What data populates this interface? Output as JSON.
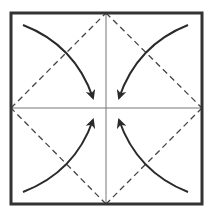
{
  "diagram": {
    "canvas": {
      "width": 215,
      "height": 222
    },
    "colors": {
      "border": "#333333",
      "crease": "#777777",
      "dashed": "#444444",
      "arrow": "#2a2a2a",
      "background": "#ffffff"
    },
    "square": {
      "x1": 11,
      "y1": 13,
      "x2": 202,
      "y2": 204,
      "stroke_width": 3
    },
    "center": {
      "x": 106,
      "y": 108
    },
    "crease_lines": [
      {
        "name": "vertical-crease",
        "x1": 106,
        "y1": 14,
        "x2": 106,
        "y2": 203
      },
      {
        "name": "horizontal-crease",
        "x1": 12,
        "y1": 108,
        "x2": 201,
        "y2": 108
      }
    ],
    "valley_fold_diamond": {
      "points": [
        [
          106,
          13
        ],
        [
          202,
          108
        ],
        [
          106,
          204
        ],
        [
          11,
          108
        ]
      ],
      "dash": "6 4"
    },
    "arrows": [
      {
        "name": "arrow-top-left-to-center",
        "path": "M23 25 Q75 45 93 98",
        "tip": [
          93,
          98
        ]
      },
      {
        "name": "arrow-top-right-to-center",
        "path": "M188 25 Q137 45 119 98",
        "tip": [
          119,
          98
        ]
      },
      {
        "name": "arrow-bottom-left-to-center",
        "path": "M23 192 Q75 172 93 120",
        "tip": [
          93,
          120
        ]
      },
      {
        "name": "arrow-bottom-right-to-center",
        "path": "M188 192 Q137 172 119 120",
        "tip": [
          119,
          120
        ]
      }
    ]
  }
}
